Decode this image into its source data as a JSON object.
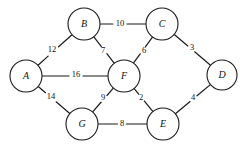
{
  "diagram": {
    "background_color": "#ffffff",
    "stroke_color": "#1a1a1a",
    "nodes": [
      {
        "id": "A",
        "label": "A",
        "cx": 26,
        "cy": 76,
        "r": 16
      },
      {
        "id": "B",
        "label": "B",
        "cx": 84,
        "cy": 24,
        "r": 16
      },
      {
        "id": "C",
        "label": "C",
        "cx": 162,
        "cy": 24,
        "r": 16
      },
      {
        "id": "D",
        "label": "D",
        "cx": 222,
        "cy": 75,
        "r": 15
      },
      {
        "id": "E",
        "label": "E",
        "cx": 163,
        "cy": 124,
        "r": 16
      },
      {
        "id": "F",
        "label": "F",
        "cx": 124,
        "cy": 76,
        "r": 16
      },
      {
        "id": "G",
        "label": "G",
        "cx": 82,
        "cy": 124,
        "r": 16
      }
    ],
    "edges": [
      {
        "from": "B",
        "to": "C",
        "weight": "10",
        "lx": 120,
        "ly": 24
      },
      {
        "from": "A",
        "to": "B",
        "weight": "12",
        "lx": 52,
        "ly": 50
      },
      {
        "from": "B",
        "to": "F",
        "weight": "7",
        "lx": 103,
        "ly": 51
      },
      {
        "from": "C",
        "to": "F",
        "weight": "6",
        "lx": 144,
        "ly": 51
      },
      {
        "from": "C",
        "to": "D",
        "weight": "3",
        "lx": 192,
        "ly": 48
      },
      {
        "from": "A",
        "to": "F",
        "weight": "16",
        "lx": 76,
        "ly": 75
      },
      {
        "from": "A",
        "to": "G",
        "weight": "14",
        "lx": 51,
        "ly": 97
      },
      {
        "from": "F",
        "to": "G",
        "weight": "9",
        "lx": 103,
        "ly": 98
      },
      {
        "from": "F",
        "to": "E",
        "weight": "2",
        "lx": 141,
        "ly": 98
      },
      {
        "from": "D",
        "to": "E",
        "weight": "4",
        "lx": 193,
        "ly": 98
      },
      {
        "from": "G",
        "to": "E",
        "weight": "8",
        "lx": 122,
        "ly": 124
      }
    ]
  }
}
